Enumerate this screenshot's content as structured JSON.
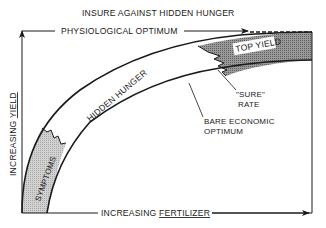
{
  "diagram": {
    "title": "INSURE AGAINST HIDDEN HUNGER",
    "top_label": "PHYSIOLOGICAL OPTIMUM",
    "y_axis": {
      "prefix": "INCREASING ",
      "emphasis": "YIELD"
    },
    "x_axis": {
      "prefix": "INCREASING ",
      "emphasis": "FERTILIZER"
    },
    "zones": [
      {
        "id": "symptoms",
        "label": "SYMPTOMS",
        "fill": "#c4c4c4"
      },
      {
        "id": "hidden-hunger",
        "label": "HIDDEN HUNGER",
        "fill": "#ffffff"
      },
      {
        "id": "top-yield",
        "label": "TOP YIELD",
        "fill": "#8a8a8a"
      }
    ],
    "callouts": {
      "sure_rate_line1": "\"SURE\"",
      "sure_rate_line2": "RATE",
      "bare_economic_line1": "BARE ECONOMIC",
      "bare_economic_line2": "OPTIMUM"
    },
    "colors": {
      "ink": "#1a1a1a",
      "symptoms_band": "#c4c4c4",
      "top_yield_band": "#8a8a8a",
      "background": "#ffffff"
    }
  }
}
